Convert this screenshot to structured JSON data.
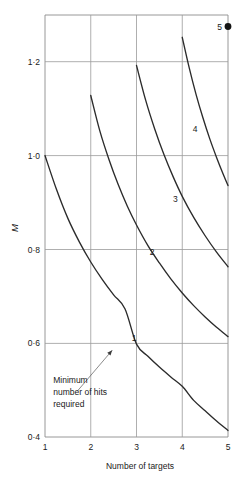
{
  "chart_data": {
    "type": "line",
    "title": "",
    "xlabel": "Number of targets",
    "ylabel": "M",
    "xlim": [
      1,
      5
    ],
    "ylim": [
      0.4,
      1.3
    ],
    "grid": true,
    "legend_position": "inline-curve-labels",
    "x_ticks": [
      "1",
      "2",
      "3",
      "4",
      "5"
    ],
    "x_tick_values": [
      1,
      2,
      3,
      4,
      5
    ],
    "y_ticks": [
      "0·4",
      "0·6",
      "0·8",
      "1·0",
      "1·2"
    ],
    "y_tick_values": [
      0.4,
      0.6,
      0.8,
      1.0,
      1.2
    ],
    "series": [
      {
        "name": "1",
        "label": "1",
        "label_x": 2.95,
        "label_y": 0.605,
        "x": [
          1.0,
          1.25,
          1.5,
          1.75,
          2.0,
          2.25,
          2.5,
          2.75,
          3.0,
          3.25,
          3.5,
          3.75,
          4.0,
          4.25,
          4.5,
          4.75,
          5.0
        ],
        "y": [
          1.0,
          0.928,
          0.866,
          0.816,
          0.773,
          0.736,
          0.703,
          0.673,
          0.598,
          0.572,
          0.549,
          0.528,
          0.508,
          0.478,
          0.456,
          0.434,
          0.414
        ]
      },
      {
        "name": "2",
        "label": "2",
        "label_x": 3.34,
        "label_y": 0.789,
        "x": [
          2.0,
          2.2,
          2.4,
          2.6,
          2.8,
          3.0,
          3.25,
          3.5,
          3.75,
          4.0,
          4.25,
          4.5,
          4.75,
          5.0
        ],
        "y": [
          1.128,
          1.052,
          0.991,
          0.938,
          0.892,
          0.852,
          0.808,
          0.771,
          0.737,
          0.707,
          0.68,
          0.656,
          0.634,
          0.614
        ]
      },
      {
        "name": "3",
        "label": "3",
        "label_x": 3.85,
        "label_y": 0.901,
        "x": [
          3.0,
          3.2,
          3.4,
          3.6,
          3.8,
          4.0,
          4.25,
          4.5,
          4.75,
          5.0
        ],
        "y": [
          1.192,
          1.118,
          1.056,
          1.002,
          0.955,
          0.913,
          0.868,
          0.829,
          0.794,
          0.763
        ]
      },
      {
        "name": "4",
        "label": "4",
        "label_x": 4.28,
        "label_y": 1.05,
        "x": [
          4.0,
          4.15,
          4.3,
          4.45,
          4.6,
          4.75,
          4.9,
          5.0
        ],
        "y": [
          1.252,
          1.188,
          1.131,
          1.081,
          1.036,
          0.996,
          0.959,
          0.936
        ]
      }
    ],
    "points": [
      {
        "label": "5",
        "x": 5,
        "y": 1.275,
        "marker": "filled-circle"
      }
    ],
    "annotations": [
      {
        "text_lines": [
          "Minimum",
          "number of hits",
          "required"
        ],
        "text_x": 1.18,
        "text_y": 0.515,
        "arrow_from_x": 1.7,
        "arrow_from_y": 0.497,
        "arrow_to_x": 2.47,
        "arrow_to_y": 0.585
      }
    ]
  },
  "labels": {
    "y_tick_0": "0·4",
    "y_tick_1": "0·6",
    "y_tick_2": "0·8",
    "y_tick_3": "1·0",
    "y_tick_4": "1·2",
    "x_tick_0": "1",
    "x_tick_1": "2",
    "x_tick_2": "3",
    "x_tick_3": "4",
    "x_tick_4": "5",
    "x_axis_title": "Number of targets",
    "y_axis_title": "M",
    "curve_1": "1",
    "curve_2": "2",
    "curve_3": "3",
    "curve_4": "4",
    "point_5": "5",
    "annot_line_1": "Minimum",
    "annot_line_2": "number of hits",
    "annot_line_3": "required"
  },
  "colors": {
    "curve": "#2b2b2b",
    "grid": "#9a9a9a",
    "frame": "#8c8c8c",
    "text": "#1a1a1a",
    "marker": "#141414",
    "background": "#ffffff"
  }
}
